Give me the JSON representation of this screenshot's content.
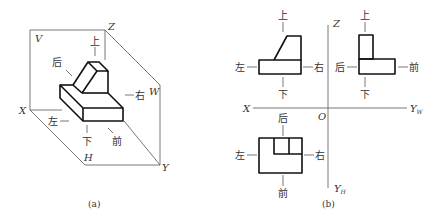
{
  "figure_a": {
    "caption": "(a)",
    "planes": {
      "v": "V",
      "w": "W",
      "h": "H"
    },
    "axes": {
      "x": "X",
      "y": "Y",
      "z": "Z"
    },
    "directions": {
      "up": "上",
      "down": "下",
      "left": "左",
      "right": "右",
      "front": "前",
      "back": "后"
    }
  },
  "figure_b": {
    "caption": "(b)",
    "axes": {
      "x": "X",
      "z": "Z",
      "origin": "O",
      "yw": "Y",
      "yw_sub": "W",
      "yh": "Y",
      "yh_sub": "H"
    },
    "front_view": {
      "up": "上",
      "down": "下",
      "left": "左",
      "right": "右"
    },
    "side_view": {
      "up": "上",
      "down": "下",
      "back": "后",
      "front": "前"
    },
    "top_view": {
      "back": "后",
      "front": "前",
      "left": "左",
      "right": "右"
    }
  }
}
